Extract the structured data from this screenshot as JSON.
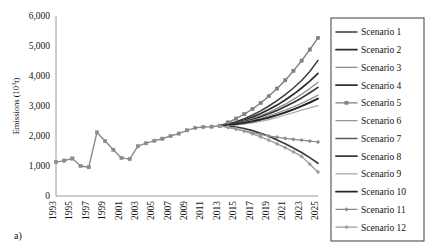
{
  "figure": {
    "panel_label": "a)",
    "background_color": "#ffffff"
  },
  "axes": {
    "y_axis_title": "Emissions (10",
    "y_axis_title_sup": "3",
    "y_axis_title_tail": "t)",
    "y_ticks": [
      "0",
      "1,000",
      "2,000",
      "3,000",
      "4,000",
      "5,000",
      "6,000"
    ],
    "x_ticks": [
      "1993",
      "1995",
      "1997",
      "1999",
      "2001",
      "2003",
      "2005",
      "2007",
      "2009",
      "2011",
      "2013",
      "2015",
      "2017",
      "2019",
      "2021",
      "2023",
      "2025"
    ],
    "axis_color": "#9a9a9a"
  },
  "legend": {
    "border_color": "#4d4d4d",
    "items": [
      {
        "label": "Scenario 1",
        "color": "#3d3d3d",
        "width": 1.5,
        "marker": "none"
      },
      {
        "label": "Scenario 2",
        "color": "#2b2b2b",
        "width": 1.7,
        "marker": "none"
      },
      {
        "label": "Scenario 3",
        "color": "#8e8e8e",
        "width": 1.3,
        "marker": "none"
      },
      {
        "label": "Scenario 4",
        "color": "#333333",
        "width": 1.7,
        "marker": "none"
      },
      {
        "label": "Scenario 5",
        "color": "#7f7f7f",
        "width": 1.4,
        "marker": "square"
      },
      {
        "label": "Scenario 6",
        "color": "#949494",
        "width": 1.3,
        "marker": "none"
      },
      {
        "label": "Scenario 7",
        "color": "#5c5c5c",
        "width": 1.5,
        "marker": "none"
      },
      {
        "label": "Scenario 8",
        "color": "#3a3a3a",
        "width": 1.7,
        "marker": "none"
      },
      {
        "label": "Scenario 9",
        "color": "#aaaaaa",
        "width": 1.3,
        "marker": "none"
      },
      {
        "label": "Scenario 10",
        "color": "#262626",
        "width": 1.8,
        "marker": "none"
      },
      {
        "label": "Scenario 11",
        "color": "#8a8a8a",
        "width": 1.2,
        "marker": "diamond"
      },
      {
        "label": "Scenario 12",
        "color": "#9c9c9c",
        "width": 1.3,
        "marker": "diamond"
      }
    ]
  },
  "chart_data": {
    "type": "line",
    "title": "",
    "xlabel": "",
    "ylabel": "Emissions (10³t)",
    "xlim": [
      1993,
      2025
    ],
    "ylim": [
      0,
      6000
    ],
    "grid": false,
    "legend_position": "right",
    "x": [
      1993,
      1994,
      1995,
      1996,
      1997,
      1998,
      1999,
      2000,
      2001,
      2002,
      2003,
      2004,
      2005,
      2006,
      2007,
      2008,
      2009,
      2010,
      2011,
      2012,
      2013,
      2014,
      2015,
      2016,
      2017,
      2018,
      2019,
      2020,
      2021,
      2022,
      2023,
      2024,
      2025
    ],
    "historical": {
      "name": "Historical",
      "color": "#8a8a8a",
      "marker": "square",
      "x": [
        1993,
        1994,
        1995,
        1996,
        1997,
        1998,
        1999,
        2000,
        2001,
        2002,
        2003,
        2004,
        2005,
        2006,
        2007,
        2008,
        2009,
        2010,
        2011,
        2012,
        2013
      ],
      "values": [
        1130,
        1180,
        1250,
        1000,
        960,
        2120,
        1830,
        1540,
        1270,
        1230,
        1660,
        1760,
        1840,
        1910,
        2000,
        2080,
        2190,
        2270,
        2300,
        2310,
        2340
      ]
    },
    "series": [
      {
        "name": "Scenario 1",
        "color": "#3d3d3d",
        "marker": "none",
        "values": [
          null,
          null,
          null,
          null,
          null,
          null,
          null,
          null,
          null,
          null,
          null,
          null,
          null,
          null,
          null,
          null,
          null,
          null,
          null,
          null,
          2340,
          2400,
          2480,
          2580,
          2700,
          2840,
          3000,
          3180,
          3380,
          3600,
          3850,
          4150,
          4520
        ]
      },
      {
        "name": "Scenario 2",
        "color": "#2b2b2b",
        "marker": "none",
        "values": [
          null,
          null,
          null,
          null,
          null,
          null,
          null,
          null,
          null,
          null,
          null,
          null,
          null,
          null,
          null,
          null,
          null,
          null,
          null,
          null,
          2340,
          2390,
          2450,
          2530,
          2630,
          2750,
          2880,
          3030,
          3200,
          3390,
          3600,
          3830,
          4090
        ]
      },
      {
        "name": "Scenario 3",
        "color": "#8e8e8e",
        "marker": "none",
        "values": [
          null,
          null,
          null,
          null,
          null,
          null,
          null,
          null,
          null,
          null,
          null,
          null,
          null,
          null,
          null,
          null,
          null,
          null,
          null,
          null,
          2340,
          2380,
          2430,
          2500,
          2580,
          2680,
          2790,
          2920,
          3060,
          3220,
          3390,
          3580,
          3790
        ]
      },
      {
        "name": "Scenario 4",
        "color": "#333333",
        "marker": "none",
        "values": [
          null,
          null,
          null,
          null,
          null,
          null,
          null,
          null,
          null,
          null,
          null,
          null,
          null,
          null,
          null,
          null,
          null,
          null,
          null,
          null,
          2340,
          2380,
          2420,
          2480,
          2550,
          2640,
          2740,
          2850,
          2980,
          3120,
          3270,
          3440,
          3620
        ]
      },
      {
        "name": "Scenario 5",
        "color": "#7f7f7f",
        "marker": "square",
        "values": [
          null,
          null,
          null,
          null,
          null,
          null,
          null,
          null,
          null,
          null,
          null,
          null,
          null,
          null,
          null,
          null,
          null,
          null,
          null,
          null,
          2340,
          2450,
          2580,
          2730,
          2900,
          3100,
          3330,
          3580,
          3860,
          4170,
          4510,
          4880,
          5270
        ]
      },
      {
        "name": "Scenario 6",
        "color": "#949494",
        "marker": "none",
        "values": [
          null,
          null,
          null,
          null,
          null,
          null,
          null,
          null,
          null,
          null,
          null,
          null,
          null,
          null,
          null,
          null,
          null,
          null,
          null,
          null,
          2340,
          2370,
          2410,
          2460,
          2520,
          2590,
          2670,
          2760,
          2860,
          2970,
          3090,
          3220,
          3360
        ]
      },
      {
        "name": "Scenario 7",
        "color": "#5c5c5c",
        "marker": "none",
        "values": [
          null,
          null,
          null,
          null,
          null,
          null,
          null,
          null,
          null,
          null,
          null,
          null,
          null,
          null,
          null,
          null,
          null,
          null,
          null,
          null,
          2340,
          2360,
          2390,
          2430,
          2480,
          2540,
          2610,
          2690,
          2780,
          2880,
          2990,
          3110,
          3240
        ]
      },
      {
        "name": "Scenario 8",
        "color": "#3a3a3a",
        "marker": "none",
        "values": [
          null,
          null,
          null,
          null,
          null,
          null,
          null,
          null,
          null,
          null,
          null,
          null,
          null,
          null,
          null,
          null,
          null,
          null,
          null,
          null,
          2340,
          2330,
          2300,
          2250,
          2180,
          2090,
          1990,
          1870,
          1740,
          1600,
          1450,
          1280,
          1090
        ]
      },
      {
        "name": "Scenario 9",
        "color": "#aaaaaa",
        "marker": "none",
        "values": [
          null,
          null,
          null,
          null,
          null,
          null,
          null,
          null,
          null,
          null,
          null,
          null,
          null,
          null,
          null,
          null,
          null,
          null,
          null,
          null,
          2340,
          2350,
          2370,
          2400,
          2440,
          2490,
          2550,
          2620,
          2700,
          2780,
          2860,
          2940,
          3010
        ]
      },
      {
        "name": "Scenario 10",
        "color": "#262626",
        "marker": "none",
        "values": [
          null,
          null,
          null,
          null,
          null,
          null,
          null,
          null,
          null,
          null,
          null,
          null,
          null,
          null,
          null,
          null,
          null,
          null,
          null,
          null,
          2340,
          2370,
          2400,
          2440,
          2490,
          2550,
          2620,
          2700,
          2790,
          2890,
          3000,
          3120,
          3250
        ]
      },
      {
        "name": "Scenario 11",
        "color": "#8a8a8a",
        "marker": "diamond",
        "values": [
          null,
          null,
          null,
          null,
          null,
          null,
          null,
          null,
          null,
          null,
          null,
          null,
          null,
          null,
          null,
          null,
          null,
          null,
          null,
          null,
          2340,
          2290,
          2230,
          2170,
          2110,
          2050,
          2000,
          1960,
          1920,
          1890,
          1860,
          1830,
          1800
        ]
      },
      {
        "name": "Scenario 12",
        "color": "#9c9c9c",
        "marker": "diamond",
        "values": [
          null,
          null,
          null,
          null,
          null,
          null,
          null,
          null,
          null,
          null,
          null,
          null,
          null,
          null,
          null,
          null,
          null,
          null,
          null,
          null,
          2340,
          2300,
          2240,
          2160,
          2070,
          1970,
          1860,
          1740,
          1610,
          1470,
          1320,
          1060,
          800
        ]
      }
    ]
  }
}
